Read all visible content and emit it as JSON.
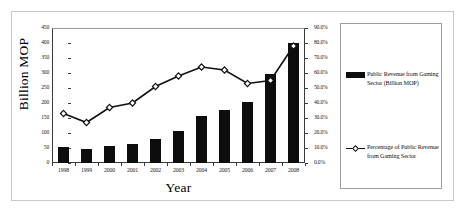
{
  "chart_data": {
    "type": "bar",
    "title": "",
    "subtitle": "",
    "xlabel": "Year",
    "ylabel": "Billion MOP",
    "y2label": "",
    "categories": [
      "1998",
      "1999",
      "2000",
      "2001",
      "2002",
      "2003",
      "2004",
      "2005",
      "2006",
      "2007",
      "2008"
    ],
    "ylim": [
      0,
      450
    ],
    "y2lim": [
      0,
      0.9
    ],
    "yticks": [
      "0",
      "50",
      "100",
      "150",
      "200",
      "250",
      "300",
      "350",
      "400",
      "450"
    ],
    "y2ticks": [
      "0.0%",
      "10.0%",
      "20.0%",
      "30.0%",
      "40.0%",
      "50.0%",
      "60.0%",
      "70.0%",
      "80.0%",
      "90.0%"
    ],
    "grid": false,
    "legend_position": "right",
    "series": [
      {
        "name": "Public Revenue from Gaming Sector (Billion MOP)",
        "type": "bar",
        "axis": "left",
        "color": "#0d0d0d",
        "values": [
          53,
          48,
          57,
          65,
          80,
          107,
          157,
          178,
          203,
          298,
          400
        ]
      },
      {
        "name": "Percentage of  Public Revenue from Gaming Sector",
        "type": "line",
        "axis": "right",
        "color": "#111111",
        "marker": "diamond",
        "values": [
          33.0,
          27.0,
          37.0,
          40.0,
          51.0,
          58.0,
          64.0,
          62.0,
          53.0,
          55.0,
          78.0
        ]
      }
    ]
  },
  "axes": {
    "y_title": "Billion MOP",
    "x_title": "Year"
  },
  "legend": {
    "items": [
      {
        "label": "Public Revenue from Gaming Sector (Billion MOP)",
        "swatch": "bar-swatch"
      },
      {
        "label": "Percentage of  Public Revenue from Gaming Sector",
        "swatch": "line-marker-swatch"
      }
    ]
  },
  "colors": {
    "bar": "#0d0d0d",
    "line": "#111111",
    "marker_fill": "#ffffff",
    "axis": "#3a3a3a",
    "frame": "#c9c9c9",
    "legend_border": "#9d9d9d"
  }
}
